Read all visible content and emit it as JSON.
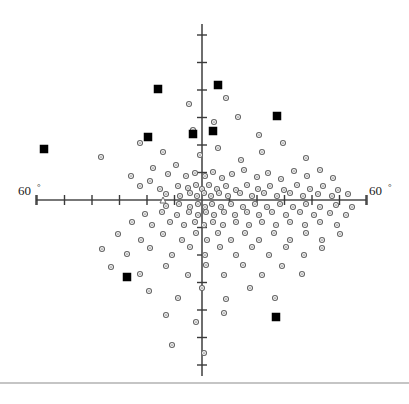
{
  "figure": {
    "title": "",
    "width": 409,
    "height": 404,
    "background": "#ffffff"
  },
  "labels": {
    "left_axis_value": "60",
    "left_axis_degree": "°",
    "right_axis_value": "60",
    "right_axis_degree": "°"
  },
  "colors": {
    "axis": "#4a4a4a",
    "tick": "#3a3a3a",
    "open_marker_stroke": "#666666",
    "open_marker_fill": "#ffffff",
    "filled_marker": "#000000",
    "text": "#1a1a1a",
    "footer_rule": "#8c8c8c"
  },
  "chart_data": {
    "type": "scatter",
    "title": "",
    "xlabel": "",
    "ylabel": "",
    "xlim": [
      -60,
      60
    ],
    "ylim": [
      -60,
      60
    ],
    "grid": false,
    "legend": "none",
    "axis_labels": {
      "x_min_tick_label": "60°",
      "x_max_tick_label": "60°"
    },
    "axes": {
      "origin_px": [
        202,
        200
      ],
      "x_axis_extent_px": [
        36,
        366
      ],
      "y_axis_extent_px": [
        24,
        376
      ],
      "x_tick_spacing_px": 27.5,
      "y_tick_spacing_px": 27.5,
      "x_tick_count_each_side": 6,
      "y_tick_count_each_side": 6,
      "tick_half_length_px": 5
    },
    "series": [
      {
        "name": "open-circles",
        "marker": "circle-open",
        "size_px": 5,
        "points_px": [
          [
            140,
            143
          ],
          [
            163,
            152
          ],
          [
            101,
            157
          ],
          [
            153,
            168
          ],
          [
            176,
            165
          ],
          [
            200,
            155
          ],
          [
            218,
            148
          ],
          [
            241,
            160
          ],
          [
            262,
            152
          ],
          [
            283,
            143
          ],
          [
            306,
            158
          ],
          [
            193,
            130
          ],
          [
            214,
            122
          ],
          [
            238,
            117
          ],
          [
            259,
            135
          ],
          [
            189,
            104
          ],
          [
            226,
            98
          ],
          [
            131,
            176
          ],
          [
            150,
            181
          ],
          [
            168,
            174
          ],
          [
            186,
            176
          ],
          [
            195,
            173
          ],
          [
            205,
            176
          ],
          [
            213,
            172
          ],
          [
            222,
            178
          ],
          [
            232,
            174
          ],
          [
            244,
            170
          ],
          [
            257,
            177
          ],
          [
            268,
            173
          ],
          [
            281,
            179
          ],
          [
            294,
            171
          ],
          [
            307,
            176
          ],
          [
            320,
            170
          ],
          [
            333,
            178
          ],
          [
            140,
            186
          ],
          [
            160,
            189
          ],
          [
            178,
            186
          ],
          [
            188,
            188
          ],
          [
            196,
            185
          ],
          [
            202,
            189
          ],
          [
            209,
            185
          ],
          [
            217,
            189
          ],
          [
            226,
            186
          ],
          [
            236,
            190
          ],
          [
            247,
            185
          ],
          [
            258,
            189
          ],
          [
            270,
            186
          ],
          [
            284,
            190
          ],
          [
            297,
            185
          ],
          [
            310,
            189
          ],
          [
            323,
            186
          ],
          [
            338,
            190
          ],
          [
            166,
            194
          ],
          [
            180,
            196
          ],
          [
            190,
            193
          ],
          [
            197,
            196
          ],
          [
            204,
            193
          ],
          [
            211,
            196
          ],
          [
            219,
            193
          ],
          [
            228,
            196
          ],
          [
            240,
            193
          ],
          [
            252,
            196
          ],
          [
            264,
            193
          ],
          [
            277,
            196
          ],
          [
            290,
            193
          ],
          [
            303,
            196
          ],
          [
            318,
            194
          ],
          [
            332,
            196
          ],
          [
            348,
            194
          ],
          [
            166,
            206
          ],
          [
            179,
            204
          ],
          [
            190,
            207
          ],
          [
            198,
            204
          ],
          [
            205,
            207
          ],
          [
            212,
            204
          ],
          [
            221,
            207
          ],
          [
            231,
            204
          ],
          [
            243,
            207
          ],
          [
            255,
            204
          ],
          [
            267,
            207
          ],
          [
            280,
            204
          ],
          [
            293,
            207
          ],
          [
            306,
            204
          ],
          [
            320,
            207
          ],
          [
            336,
            205
          ],
          [
            352,
            207
          ],
          [
            145,
            214
          ],
          [
            162,
            212
          ],
          [
            177,
            215
          ],
          [
            189,
            212
          ],
          [
            198,
            215
          ],
          [
            206,
            212
          ],
          [
            214,
            215
          ],
          [
            224,
            212
          ],
          [
            235,
            215
          ],
          [
            247,
            212
          ],
          [
            259,
            215
          ],
          [
            272,
            212
          ],
          [
            286,
            215
          ],
          [
            300,
            212
          ],
          [
            314,
            215
          ],
          [
            330,
            213
          ],
          [
            346,
            215
          ],
          [
            132,
            222
          ],
          [
            152,
            225
          ],
          [
            170,
            222
          ],
          [
            184,
            225
          ],
          [
            195,
            222
          ],
          [
            204,
            225
          ],
          [
            213,
            222
          ],
          [
            223,
            225
          ],
          [
            236,
            222
          ],
          [
            249,
            225
          ],
          [
            262,
            222
          ],
          [
            276,
            225
          ],
          [
            290,
            222
          ],
          [
            305,
            225
          ],
          [
            320,
            222
          ],
          [
            337,
            225
          ],
          [
            118,
            234
          ],
          [
            141,
            240
          ],
          [
            163,
            234
          ],
          [
            182,
            240
          ],
          [
            196,
            233
          ],
          [
            207,
            240
          ],
          [
            218,
            233
          ],
          [
            231,
            240
          ],
          [
            245,
            233
          ],
          [
            259,
            240
          ],
          [
            274,
            233
          ],
          [
            290,
            240
          ],
          [
            306,
            233
          ],
          [
            322,
            240
          ],
          [
            340,
            234
          ],
          [
            102,
            249
          ],
          [
            127,
            254
          ],
          [
            150,
            248
          ],
          [
            172,
            255
          ],
          [
            190,
            247
          ],
          [
            205,
            255
          ],
          [
            220,
            247
          ],
          [
            236,
            255
          ],
          [
            252,
            247
          ],
          [
            269,
            255
          ],
          [
            286,
            247
          ],
          [
            304,
            255
          ],
          [
            322,
            248
          ],
          [
            111,
            267
          ],
          [
            140,
            274
          ],
          [
            166,
            266
          ],
          [
            188,
            275
          ],
          [
            206,
            265
          ],
          [
            224,
            275
          ],
          [
            243,
            265
          ],
          [
            262,
            275
          ],
          [
            282,
            266
          ],
          [
            302,
            274
          ],
          [
            149,
            291
          ],
          [
            178,
            298
          ],
          [
            202,
            288
          ],
          [
            226,
            299
          ],
          [
            250,
            288
          ],
          [
            275,
            298
          ],
          [
            166,
            315
          ],
          [
            196,
            322
          ],
          [
            224,
            313
          ],
          [
            172,
            345
          ],
          [
            204,
            353
          ]
        ]
      },
      {
        "name": "filled-squares",
        "marker": "square-filled",
        "size_px": 8,
        "points_px": [
          [
            44,
            149
          ],
          [
            148,
            137
          ],
          [
            158,
            89
          ],
          [
            193,
            134
          ],
          [
            213,
            131
          ],
          [
            218,
            85
          ],
          [
            277,
            116
          ],
          [
            127,
            277
          ],
          [
            276,
            317
          ]
        ]
      },
      {
        "name": "open-triangle",
        "marker": "triangle-open",
        "size_px": 6,
        "points_px": [
          [
            163,
            200
          ]
        ]
      }
    ]
  },
  "footer": {
    "rule_y_px": 383
  }
}
